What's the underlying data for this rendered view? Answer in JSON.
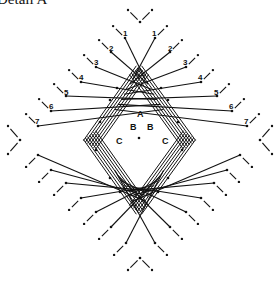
{
  "title": "Detail A",
  "center": {
    "x": 139,
    "y": 140
  },
  "labels": {
    "A": "A",
    "B": "B",
    "C": "C"
  },
  "label_positions": [
    {
      "text": "A",
      "x": 137,
      "y": 117
    },
    {
      "text": "B",
      "x": 130,
      "y": 130
    },
    {
      "text": "B",
      "x": 147,
      "y": 130
    },
    {
      "text": "C",
      "x": 116,
      "y": 144
    },
    {
      "text": "C",
      "x": 162,
      "y": 144
    }
  ],
  "strand_numbers": [
    "1",
    "2",
    "3",
    "4",
    "5",
    "6",
    "7"
  ],
  "upper_left_numbers": [
    {
      "n": "1",
      "x": 123,
      "y": 36,
      "anchor": [
        125,
        38
      ]
    },
    {
      "n": "2",
      "x": 109,
      "y": 51,
      "anchor": [
        111,
        52
      ]
    },
    {
      "n": "3",
      "x": 94,
      "y": 65,
      "anchor": [
        96,
        67
      ]
    },
    {
      "n": "4",
      "x": 79,
      "y": 80,
      "anchor": [
        81,
        82
      ]
    },
    {
      "n": "5",
      "x": 64,
      "y": 95,
      "anchor": [
        66,
        96
      ]
    },
    {
      "n": "6",
      "x": 49,
      "y": 109,
      "anchor": [
        51,
        111
      ]
    },
    {
      "n": "7",
      "x": 35,
      "y": 124,
      "anchor": [
        38,
        126
      ]
    }
  ],
  "upper_right_numbers": [
    {
      "n": "1",
      "x": 152,
      "y": 36,
      "anchor": [
        155,
        38
      ]
    },
    {
      "n": "2",
      "x": 168,
      "y": 51,
      "anchor": [
        170,
        52
      ]
    },
    {
      "n": "3",
      "x": 183,
      "y": 65,
      "anchor": [
        186,
        67
      ]
    },
    {
      "n": "4",
      "x": 198,
      "y": 80,
      "anchor": [
        201,
        82
      ]
    },
    {
      "n": "5",
      "x": 214,
      "y": 95,
      "anchor": [
        217,
        96
      ]
    },
    {
      "n": "6",
      "x": 229,
      "y": 109,
      "anchor": [
        232,
        111
      ]
    },
    {
      "n": "7",
      "x": 244,
      "y": 124,
      "anchor": [
        247,
        126
      ]
    }
  ],
  "lower_left_anchors": [
    [
      38,
      155
    ],
    [
      51,
      170
    ],
    [
      66,
      183
    ],
    [
      81,
      198
    ],
    [
      96,
      212
    ],
    [
      111,
      227
    ],
    [
      126,
      243
    ]
  ],
  "lower_right_anchors": [
    [
      240,
      155
    ],
    [
      227,
      170
    ],
    [
      214,
      183
    ],
    [
      201,
      198
    ],
    [
      186,
      212
    ],
    [
      170,
      227
    ],
    [
      155,
      243
    ]
  ],
  "outer_markers": [
    {
      "pos": "top",
      "x": 140,
      "y": 22
    },
    {
      "pos": "bottom",
      "x": 140,
      "y": 258
    },
    {
      "pos": "left",
      "x": 20,
      "y": 140
    },
    {
      "pos": "right",
      "x": 260,
      "y": 140
    }
  ],
  "diamond": {
    "top": [
      139,
      75
    ],
    "right": [
      186,
      140
    ],
    "bottom": [
      139,
      205
    ],
    "left": [
      93,
      140
    ]
  }
}
